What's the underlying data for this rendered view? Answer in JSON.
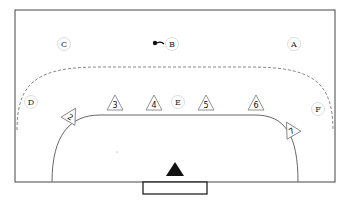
{
  "diagram": {
    "type": "handball-court-drill",
    "field": {
      "x": 15,
      "y": 10,
      "w": 320,
      "h": 172,
      "stroke": "#444444"
    },
    "goal": {
      "x": 143,
      "y": 182,
      "w": 64,
      "h": 12
    },
    "goalkeeper": {
      "x": 175,
      "y": 170,
      "color": "#111111"
    },
    "six_meter_line": {
      "left_x": 52,
      "right_x": 298,
      "bottom_y": 182,
      "top_y": 115
    },
    "nine_meter_dashed": {
      "left_x": 17,
      "right_x": 333,
      "top_y": 67,
      "bottom_y": 130
    },
    "ball": {
      "x": 155,
      "y": 43
    },
    "attackers": [
      {
        "label": "A",
        "x": 294,
        "y": 44
      },
      {
        "label": "B",
        "x": 172,
        "y": 44
      },
      {
        "label": "C",
        "x": 64,
        "y": 44
      },
      {
        "label": "D",
        "x": 31,
        "y": 102
      },
      {
        "label": "E",
        "x": 178,
        "y": 102
      },
      {
        "label": "F",
        "x": 318,
        "y": 109
      }
    ],
    "defenders": [
      {
        "label": "2",
        "x": 71,
        "y": 116,
        "rot": 30
      },
      {
        "label": "3",
        "x": 115,
        "y": 104,
        "rot": 0
      },
      {
        "label": "4",
        "x": 154,
        "y": 104,
        "rot": 0
      },
      {
        "label": "5",
        "x": 206,
        "y": 104,
        "rot": 0
      },
      {
        "label": "6",
        "x": 256,
        "y": 104,
        "rot": 0
      },
      {
        "label": "7",
        "x": 291,
        "y": 130,
        "rot": -30
      }
    ]
  }
}
